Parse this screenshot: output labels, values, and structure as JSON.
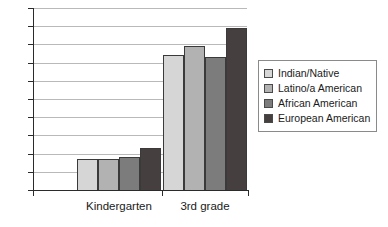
{
  "chart_data": {
    "type": "bar",
    "title": "",
    "subtitle": "",
    "xlabel": "",
    "ylabel": "",
    "categories": [
      "Kindergarten",
      "3rd grade"
    ],
    "series": [
      {
        "name": "Indian/Native",
        "values": [
          17,
          74
        ],
        "color": "#d6d6d6"
      },
      {
        "name": "Latino/a American",
        "values": [
          17,
          79
        ],
        "color": "#b2b2b2"
      },
      {
        "name": "African American",
        "values": [
          18,
          73
        ],
        "color": "#7c7c7c"
      },
      {
        "name": "European American",
        "values": [
          23,
          89
        ],
        "color": "#463f3f"
      }
    ],
    "ylim": [
      0,
      100
    ],
    "ytick_step": 10,
    "yticks": [
      "0",
      "10",
      "20",
      "30",
      "40",
      "50",
      "60",
      "70",
      "80",
      "90",
      "100"
    ],
    "grid": true,
    "grid_axis": "y",
    "legend_position": "right",
    "legend_border": true
  },
  "legend": {
    "entries": [
      {
        "label": "Indian/Native"
      },
      {
        "label": "Latino/a American"
      },
      {
        "label": "African American"
      },
      {
        "label": "European American"
      }
    ]
  },
  "axes": {
    "x_categories": [
      "Kindergarten",
      "3rd grade"
    ],
    "y_tick_labels": [
      "100",
      "90",
      "80",
      "70",
      "60",
      "50",
      "40",
      "30",
      "20",
      "10",
      "0"
    ]
  }
}
